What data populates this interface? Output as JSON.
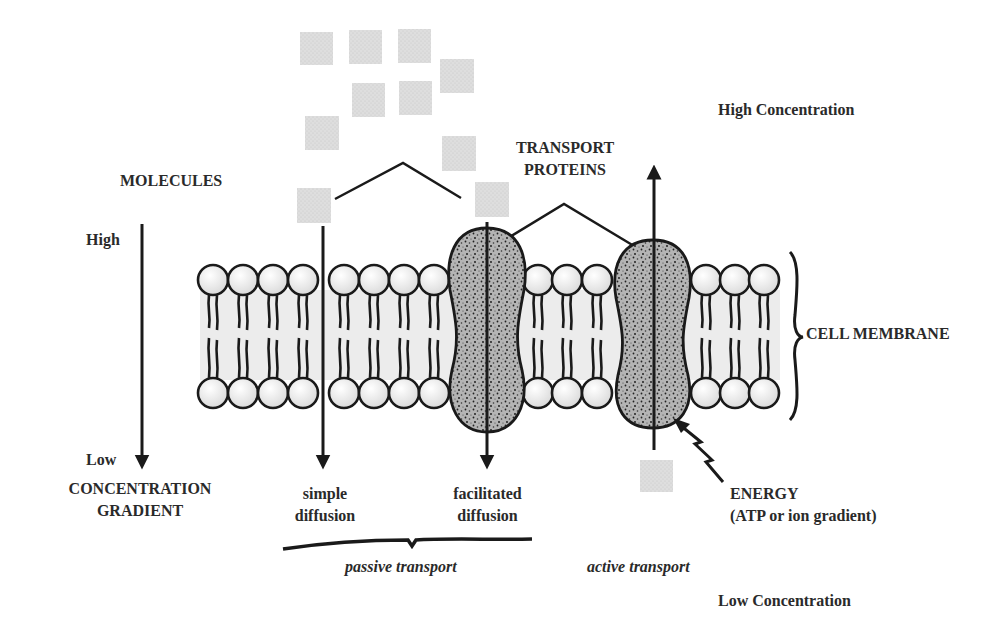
{
  "labels": {
    "high_concentration": "High Concentration",
    "low_concentration": "Low Concentration",
    "molecules": "MOLECULES",
    "transport_proteins_line1": "TRANSPORT",
    "transport_proteins_line2": "PROTEINS",
    "gradient_high": "High",
    "gradient_low": "Low",
    "concentration_gradient_line1": "CONCENTRATION",
    "concentration_gradient_line2": "GRADIENT",
    "cell_membrane": "CELL MEMBRANE",
    "simple_diffusion_line1": "simple",
    "simple_diffusion_line2": "diffusion",
    "facilitated_diffusion_line1": "facilitated",
    "facilitated_diffusion_line2": "diffusion",
    "energy_line1": "ENERGY",
    "energy_line2": "(ATP or ion gradient)",
    "passive_transport": "passive transport",
    "active_transport": "active transport"
  },
  "colors": {
    "ink": "#1a1a1a",
    "molecule_fill": "#dcdcdc",
    "protein_fill": "#a8a8a8",
    "membrane_band": "#ececec",
    "head_fill": "#f2f2f2"
  },
  "icons": {
    "molecule": "molecule-square",
    "phospholipid": "phospholipid",
    "transport_protein": "transport-protein",
    "energy": "lightning-bolt"
  }
}
